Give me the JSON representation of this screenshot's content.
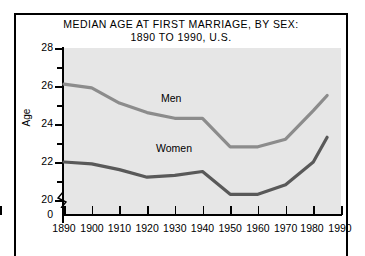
{
  "figure": {
    "background_color": "#ffffff",
    "frame_color": "#000000",
    "plot_background": "#e6e6e6"
  },
  "chart_data": {
    "type": "line",
    "title": "MEDIAN AGE AT FIRST MARRIAGE, BY SEX:\n1890 TO 1990, U.S.",
    "title_line1": "MEDIAN AGE AT FIRST MARRIAGE, BY SEX:",
    "title_line2": "1890 TO 1990, U.S.",
    "xlabel": "",
    "ylabel": "Age",
    "xlim": [
      1890,
      1990
    ],
    "ylim": [
      19.2,
      28
    ],
    "y_axis_break": true,
    "y_break_label": "0",
    "grid": false,
    "legend_position": "inline-labels",
    "xticks": [
      1890,
      1900,
      1910,
      1920,
      1930,
      1940,
      1950,
      1960,
      1970,
      1980,
      1990
    ],
    "xticklabels": [
      "1890",
      "1900",
      "1910",
      "1920",
      "1930",
      "1940",
      "1950",
      "1960",
      "1970",
      "1980",
      "1990"
    ],
    "yticks_major": [
      20,
      22,
      24,
      26,
      28
    ],
    "yticklabels_major": [
      "20",
      "22",
      "24",
      "26",
      "28"
    ],
    "yticks_minor": [
      21,
      23,
      25,
      27
    ],
    "x": [
      1890,
      1900,
      1910,
      1920,
      1930,
      1940,
      1950,
      1960,
      1970,
      1980,
      1985
    ],
    "series": [
      {
        "name": "Men",
        "label": "Men",
        "color": "#8c8c8c",
        "values": [
          26.1,
          25.9,
          25.1,
          24.6,
          24.3,
          24.3,
          22.8,
          22.8,
          23.2,
          24.7,
          25.5
        ]
      },
      {
        "name": "Women",
        "label": "Women",
        "color": "#595959",
        "values": [
          22.0,
          21.9,
          21.6,
          21.2,
          21.3,
          21.5,
          20.3,
          20.3,
          20.8,
          22.0,
          23.3
        ]
      }
    ],
    "annotations": [
      {
        "text": "Men",
        "x": 1930,
        "y": 24.9
      },
      {
        "text": "Women",
        "x": 1927,
        "y": 22.5
      }
    ]
  }
}
